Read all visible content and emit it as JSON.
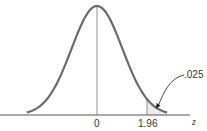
{
  "chart_data": {
    "type": "area",
    "title": "",
    "xlabel": "z",
    "ylabel": "",
    "tick_labels": [
      "0",
      "1.96"
    ],
    "x_ticks": [
      0,
      1.96
    ],
    "xlim": [
      -3.5,
      3.6
    ],
    "distribution": {
      "name": "standard normal",
      "mean": 0,
      "sd": 1
    },
    "shaded_region": {
      "from": 1.96,
      "to": 3.4,
      "area": 0.025
    },
    "annotations": [
      {
        "text": ".025",
        "points_to": "shaded upper tail"
      }
    ],
    "grid": false,
    "legend": null
  },
  "colors": {
    "curve": "#6b6b6b",
    "axis": "#555555",
    "shade": "#ececec",
    "text": "#333333"
  }
}
